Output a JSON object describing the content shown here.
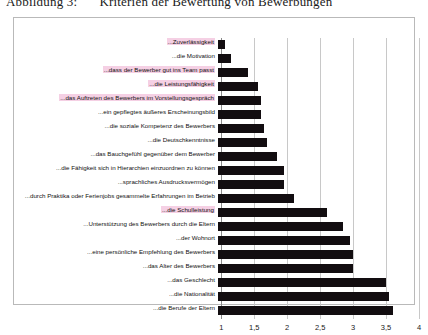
{
  "figure": {
    "caption_number": "Abbildung 3:",
    "caption_text": "Kriterien der Bewertung von Bewerbungen"
  },
  "chart_data": {
    "type": "bar",
    "orientation": "horizontal",
    "title": "Kriterien der Bewertung von Bewerbungen",
    "xlabel": "",
    "ylabel": "",
    "xlim": [
      0.95,
      4
    ],
    "grid": true,
    "legend": false,
    "xticks": [
      "1",
      "1,5",
      "2",
      "2,5",
      "3",
      "3,5",
      "4"
    ],
    "xtick_values": [
      1,
      1.5,
      2,
      2.5,
      3,
      3.5,
      4
    ],
    "categories": [
      "...Zuverlässigkeit",
      "...die Motivation",
      "...dass der Bewerber gut ins Team passt",
      "...die Leistungsfähigkeit",
      "...das Auftreten des Bewerbers im Vorstellungsgespräch",
      "...ein gepflegtes äußeres Erscheinungsbild",
      "...die soziale Kompetenz des Bewerbers",
      "...die Deutschkenntnisse",
      "...das Bauchgefühl gegenüber dem Bewerber",
      "...die Fähigkeit sich in Hierarchien einzuordnen zu können",
      "...sprachliches Ausdrucksvermögen",
      "...durch Praktika oder Ferienjobs gesammelte Erfahrungen im Betrieb",
      "...die Schulleistung",
      "...Unterstützung des Bewerbers durch die Eltern",
      "...der Wohnort",
      "...eine persönliche Empfehlung des Bewerbers",
      "...das Alter des Bewerbers",
      "...das Geschlecht",
      "...die Nationalität",
      "...die Berufe der Eltern"
    ],
    "highlighted": [
      "...Zuverlässigkeit",
      "...dass der Bewerber gut ins Team passt",
      "...die Leistungsfähigkeit",
      "...das Auftreten des Bewerbers im Vorstellungsgespräch",
      "...die Schulleistung"
    ],
    "values": [
      1.05,
      1.15,
      1.4,
      1.55,
      1.6,
      1.6,
      1.65,
      1.7,
      1.85,
      1.95,
      1.95,
      2.1,
      2.6,
      2.85,
      2.95,
      3.0,
      3.0,
      3.5,
      3.55,
      3.6
    ]
  }
}
